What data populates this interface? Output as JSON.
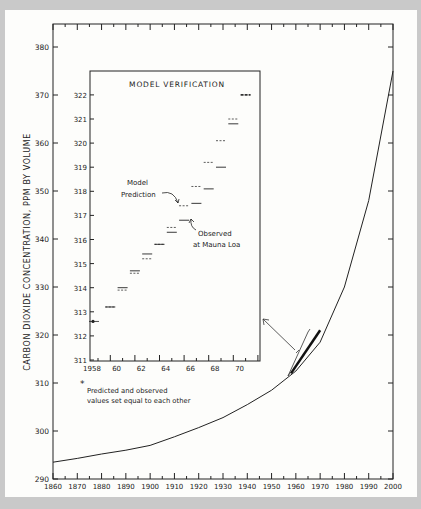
{
  "chart_data": [
    {
      "type": "line",
      "title": "",
      "xlabel": "",
      "ylabel": "CARBON DIOXIDE CONCENTRATION, PPM BY VOLUME",
      "xlim": [
        1860,
        2000
      ],
      "ylim": [
        290,
        385
      ],
      "x_ticks": [
        1860,
        1870,
        1880,
        1890,
        1900,
        1910,
        1920,
        1930,
        1940,
        1950,
        1960,
        1970,
        1980,
        1990,
        2000
      ],
      "y_ticks": [
        290,
        300,
        310,
        320,
        330,
        340,
        350,
        360,
        370,
        380
      ],
      "grid": false,
      "series": [
        {
          "name": "Model CO2 concentration",
          "x": [
            1860,
            1870,
            1880,
            1890,
            1900,
            1910,
            1920,
            1930,
            1940,
            1950,
            1960,
            1970,
            1980,
            1990,
            2000
          ],
          "y": [
            293.5,
            294.3,
            295.2,
            296.0,
            297.0,
            298.8,
            300.7,
            302.8,
            305.5,
            308.5,
            312.5,
            318.5,
            330,
            348,
            375
          ]
        },
        {
          "name": "Observed period (highlighted)",
          "x": [
            1958,
            1970
          ],
          "y": [
            312,
            321
          ]
        }
      ]
    },
    {
      "type": "scatter",
      "title": "MODEL VERIFICATION",
      "xlabel": "",
      "ylabel": "",
      "xlim": [
        1958,
        1971
      ],
      "ylim": [
        311,
        322
      ],
      "x_ticks": [
        1958,
        60,
        62,
        64,
        66,
        68,
        70
      ],
      "y_ticks": [
        311,
        312,
        313,
        314,
        315,
        316,
        317,
        318,
        319,
        320,
        321,
        322
      ],
      "series": [
        {
          "name": "Model Prediction",
          "style": "dashed",
          "x": [
            1958,
            1959,
            1960,
            1961,
            1962,
            1963,
            1964,
            1965,
            1966,
            1967,
            1968,
            1969,
            1970
          ],
          "y": [
            312.6,
            313.2,
            313.9,
            314.6,
            315.2,
            315.8,
            316.5,
            317.4,
            318.2,
            319.2,
            320.1,
            321.0,
            322.0
          ]
        },
        {
          "name": "Observed at Mauna Loa",
          "style": "solid",
          "x": [
            1958,
            1959,
            1960,
            1961,
            1962,
            1963,
            1964,
            1965,
            1966,
            1967,
            1968,
            1969,
            1970
          ],
          "y": [
            312.6,
            313.2,
            314.0,
            314.7,
            315.4,
            315.8,
            316.3,
            316.8,
            317.5,
            318.1,
            319.0,
            320.8,
            322.0
          ]
        }
      ],
      "annotations": [
        "Model Prediction",
        "Observed at Mauna Loa",
        "* Predicted and observed values set equal to each other"
      ]
    }
  ],
  "labels": {
    "ylabel": "CARBON DIOXIDE CONCENTRATION, PPM BY VOLUME",
    "inset_title": "MODEL VERIFICATION",
    "model_prediction_1": "Model",
    "model_prediction_2": "Prediction",
    "observed_1": "Observed",
    "observed_2": "at Mauna Loa",
    "footnote_star": "*",
    "footnote_1": "Predicted and observed",
    "footnote_2": "values set equal to each other"
  }
}
